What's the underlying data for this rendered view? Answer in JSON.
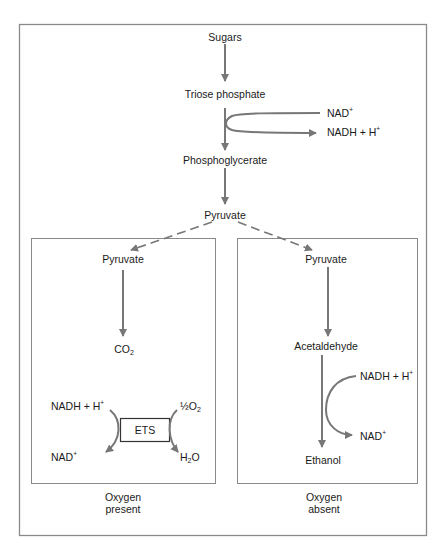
{
  "colors": {
    "arrow": "#777777",
    "frame": "#8a8a8a",
    "text": "#1a1a1a"
  },
  "main_pathway": {
    "sugars": "Sugars",
    "triose_phosphate": "Triose phosphate",
    "nad_plus": "NAD",
    "nadh_h": "NADH + H",
    "phosphoglycerate": "Phosphoglycerate",
    "pyruvate": "Pyruvate"
  },
  "aerobic": {
    "pyruvate": "Pyruvate",
    "co2": "CO",
    "co2_sub": "2",
    "nadh_h": "NADH + H",
    "nad_plus": "NAD",
    "half_o2": "½O",
    "half_o2_sub": "2",
    "h2o_h": "H",
    "h2o_sub": "2",
    "h2o_o": "O",
    "ets": "ETS",
    "caption_line1": "Oxygen",
    "caption_line2": "present"
  },
  "anaerobic": {
    "pyruvate": "Pyruvate",
    "acetaldehyde": "Acetaldehyde",
    "nadh_h": "NADH + H",
    "nad_plus": "NAD",
    "ethanol": "Ethanol",
    "caption_line1": "Oxygen",
    "caption_line2": "absent"
  },
  "superscript_plus": "+"
}
